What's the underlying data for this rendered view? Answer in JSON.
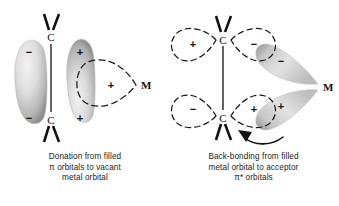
{
  "figure": {
    "background_color": "#ffffff",
    "ink_color": "#111111",
    "orbital_fill_light": "#dcdcdc",
    "orbital_fill_dark": "#9a9a9a"
  },
  "panels": [
    {
      "id": "donation",
      "caption_lines": [
        "Donation from filled",
        "π orbitals to vacant",
        "metal orbital"
      ],
      "atoms": [
        {
          "name": "carbon-top",
          "label": "C"
        },
        {
          "name": "carbon-bottom",
          "label": "C"
        },
        {
          "name": "metal",
          "label": "M"
        }
      ],
      "orbital_signs": {
        "left_lobe_top": "−",
        "left_lobe_bottom": "−",
        "right_lobe_top": "+",
        "right_lobe_bottom": "+",
        "metal_lobe": "+"
      }
    },
    {
      "id": "back-bonding",
      "caption_lines": [
        "Back-bonding from filled",
        "metal orbital to acceptor",
        "π* orbitals"
      ],
      "atoms": [
        {
          "name": "carbon-top",
          "label": "C"
        },
        {
          "name": "carbon-bottom",
          "label": "C"
        },
        {
          "name": "metal",
          "label": "M"
        }
      ],
      "orbital_signs": {
        "top_left_lobe": "+",
        "top_right_lobe": "−",
        "bottom_left_lobe": "−",
        "bottom_right_lobe": "+",
        "metal_lobe_top": "−",
        "metal_lobe_bottom": "+"
      }
    }
  ]
}
